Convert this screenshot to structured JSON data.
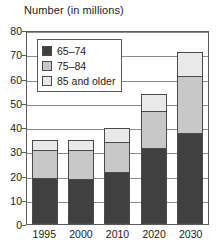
{
  "chart_data": {
    "type": "bar",
    "subtype": "stacked-vertical",
    "title": "Number (in millions)",
    "xlabel": "",
    "ylabel": "",
    "ylim": [
      0,
      80
    ],
    "ytick_step": 10,
    "yticks": [
      80,
      70,
      60,
      50,
      40,
      30,
      20,
      10,
      0
    ],
    "grid": true,
    "grid_axis": "y",
    "legend_position": "inside-top-left",
    "categories": [
      "1995",
      "2000",
      "2010",
      "2020",
      "2030"
    ],
    "series": [
      {
        "name": "65–74",
        "color": "#404040",
        "values": [
          19,
          18.5,
          21.5,
          31.5,
          37.5
        ]
      },
      {
        "name": "75–84",
        "color": "#c8c8c8",
        "values": [
          11.5,
          12,
          12.5,
          15,
          23.5
        ]
      },
      {
        "name": "85 and older",
        "color": "#e9e9e9",
        "values": [
          4,
          4.3,
          5.5,
          7.2,
          10
        ]
      }
    ],
    "totals": [
      34.5,
      34.8,
      39.5,
      53.7,
      71
    ]
  },
  "legend": {
    "items": [
      {
        "label": "65–74",
        "color": "#404040"
      },
      {
        "label": "75–84",
        "color": "#c8c8c8"
      },
      {
        "label": "85 and older",
        "color": "#e9e9e9"
      }
    ]
  },
  "colors": {
    "axis": "#5a5a5a",
    "grid": "#8c8c8c",
    "text": "#1a1a1a",
    "outline": "#4a4a4a",
    "background": "#ffffff"
  }
}
